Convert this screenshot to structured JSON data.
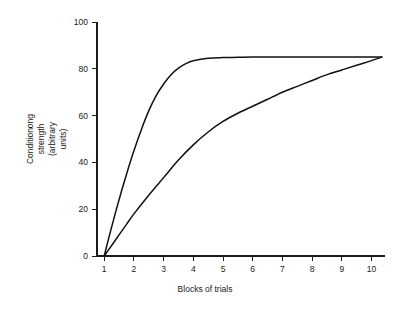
{
  "chart_data": {
    "type": "line",
    "title": "",
    "xlabel": "Blocks of trials",
    "ylabel": "Conditionong strength (arbitrary units)",
    "ylabel_lines": [
      "Conditionong",
      "strength",
      "(arbitrary",
      "units)"
    ],
    "xlim": [
      0.6,
      10.6
    ],
    "ylim": [
      0,
      100
    ],
    "xticks": [
      1,
      2,
      3,
      4,
      5,
      6,
      7,
      8,
      9,
      10
    ],
    "xtick_labels": [
      "1",
      "2",
      "3",
      "4",
      "5",
      "6",
      "7",
      "8",
      "9",
      "10"
    ],
    "yticks": [
      0,
      20,
      40,
      60,
      80,
      100
    ],
    "ytick_labels": [
      "0",
      "20",
      "40",
      "60",
      "80",
      "100"
    ],
    "grid": false,
    "legend": "none",
    "line_color": "#111111",
    "axis_color": "#1a1a1a",
    "background": "#ffffff",
    "asymptote": 85,
    "series": [
      {
        "name": "fast-acquisition-curve",
        "x": [
          1.0,
          1.2,
          1.4,
          1.6,
          1.8,
          2.0,
          2.25,
          2.5,
          2.75,
          3.0,
          3.25,
          3.5,
          3.75,
          4.0,
          4.5,
          5.0,
          5.5,
          6.0,
          7.0,
          8.0,
          9.0,
          10.0,
          10.35
        ],
        "values": [
          0,
          10,
          19.5,
          28.5,
          37,
          45,
          54,
          62,
          68.5,
          73.5,
          77.5,
          80.3,
          82.2,
          83.4,
          84.5,
          84.8,
          84.9,
          85.0,
          85.0,
          85.0,
          85.0,
          85.0,
          85.0
        ]
      },
      {
        "name": "slow-acquisition-curve",
        "x": [
          1.0,
          1.25,
          1.5,
          1.75,
          2.0,
          2.5,
          3.0,
          3.5,
          4.0,
          4.5,
          5.0,
          5.5,
          6.0,
          6.5,
          7.0,
          7.5,
          8.0,
          8.5,
          9.0,
          9.5,
          10.0,
          10.35
        ],
        "values": [
          0,
          4.5,
          9,
          13.5,
          18,
          26,
          33.5,
          41,
          47.5,
          53,
          57.5,
          61,
          64,
          67,
          70,
          72.5,
          75,
          77.5,
          79.5,
          81.5,
          83.5,
          85.0
        ]
      }
    ]
  }
}
